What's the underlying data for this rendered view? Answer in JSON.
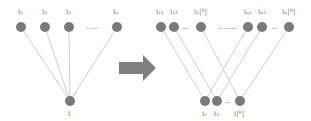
{
  "diagram": {
    "left": {
      "top_nodes": [
        {
          "id": "i1",
          "label": "i₁"
        },
        {
          "id": "i2",
          "label": "i₂"
        },
        {
          "id": "i3",
          "label": "i₃"
        },
        {
          "id": "iN",
          "label": "iₙ"
        }
      ],
      "top_ellipsis": "......",
      "bottom_node": {
        "id": "i",
        "label": "i"
      },
      "edges": [
        [
          "i1",
          "i"
        ],
        [
          "i2",
          "i"
        ],
        [
          "i3",
          "i"
        ],
        [
          "iN",
          "i"
        ]
      ]
    },
    "arrow": {
      "label": "",
      "color": "#808080"
    },
    "right": {
      "top_nodes": [
        {
          "id": "i11",
          "label": "i₁₁"
        },
        {
          "id": "i12",
          "label": "i₁₂"
        },
        {
          "id": "i1R",
          "label": "i₁|ᴿ|"
        },
        {
          "id": "iN1",
          "label": "iₙ₁"
        },
        {
          "id": "iN2",
          "label": "iₙ₂"
        },
        {
          "id": "iNR",
          "label": "iₙ|ᴿ|"
        }
      ],
      "top_ellipses": [
        "...",
        "..........",
        "..."
      ],
      "bottom_nodes": [
        {
          "id": "b1",
          "label": "i₁"
        },
        {
          "id": "b2",
          "label": "i₂"
        },
        {
          "id": "bR",
          "label": "i|ᴿ|"
        }
      ],
      "bottom_ellipsis": "...",
      "edges": [
        [
          "i11",
          "b1"
        ],
        [
          "i12",
          "b2"
        ],
        [
          "i1R",
          "bR"
        ],
        [
          "iN1",
          "b1"
        ],
        [
          "iN2",
          "b2"
        ],
        [
          "iNR",
          "bR"
        ]
      ]
    },
    "colors": {
      "node": "#7a7a7a",
      "edge": "#d0d0d0",
      "arrow": "#808080"
    }
  }
}
